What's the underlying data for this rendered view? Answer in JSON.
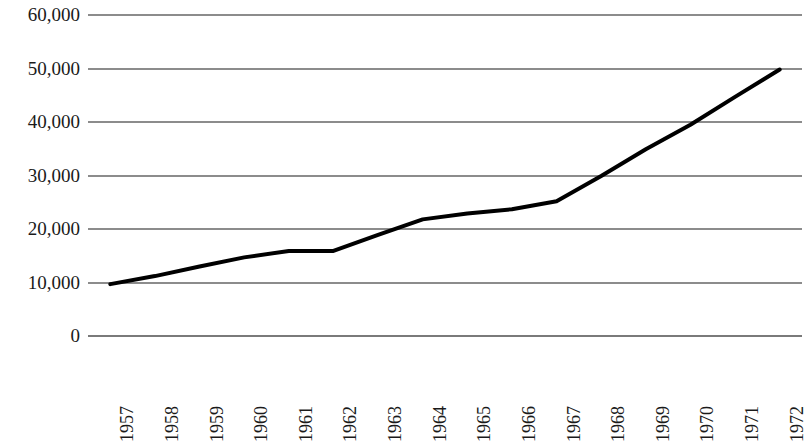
{
  "chart_data": {
    "type": "line",
    "title": "",
    "xlabel": "",
    "ylabel": "",
    "x": [
      1957,
      1958,
      1959,
      1960,
      1961,
      1962,
      1963,
      1964,
      1965,
      1966,
      1967,
      1968,
      1969,
      1970,
      1971,
      1972
    ],
    "categories": [
      "1957",
      "1958",
      "1959",
      "1960",
      "1961",
      "1962",
      "1963",
      "1964",
      "1965",
      "1966",
      "1967",
      "1968",
      "1969",
      "1970",
      "1971",
      "1972"
    ],
    "series": [
      {
        "name": "",
        "values": [
          9700,
          11200,
          13000,
          14700,
          15900,
          15900,
          18900,
          21800,
          22900,
          23700,
          25200,
          29900,
          34900,
          39500,
          44700,
          49800
        ]
      }
    ],
    "values": [
      9700,
      11200,
      13000,
      14700,
      15900,
      15900,
      18900,
      21800,
      22900,
      23700,
      25200,
      29900,
      34900,
      39500,
      44700,
      49800
    ],
    "ylim": [
      0,
      60000
    ],
    "yticks": [
      0,
      10000,
      20000,
      30000,
      40000,
      50000,
      60000
    ],
    "ytick_labels": [
      "0",
      "10,000",
      "20,000",
      "30,000",
      "40,000",
      "50,000",
      "60,000"
    ],
    "grid": true,
    "grid_axis": "y",
    "legend": false,
    "legend_position": "none",
    "line_color": "#000000",
    "grid_color": "#8c8c8c",
    "background_color": "#ffffff",
    "line_width": 4,
    "markers": false
  },
  "axes": {
    "y_ticks": [
      {
        "label": "60,000",
        "value": 60000
      },
      {
        "label": "50,000",
        "value": 50000
      },
      {
        "label": "40,000",
        "value": 40000
      },
      {
        "label": "30,000",
        "value": 30000
      },
      {
        "label": "20,000",
        "value": 20000
      },
      {
        "label": "10,000",
        "value": 10000
      },
      {
        "label": "0",
        "value": 0
      }
    ],
    "x_ticks": [
      {
        "label": "1957"
      },
      {
        "label": "1958"
      },
      {
        "label": "1959"
      },
      {
        "label": "1960"
      },
      {
        "label": "1961"
      },
      {
        "label": "1962"
      },
      {
        "label": "1963"
      },
      {
        "label": "1964"
      },
      {
        "label": "1965"
      },
      {
        "label": "1966"
      },
      {
        "label": "1967"
      },
      {
        "label": "1968"
      },
      {
        "label": "1969"
      },
      {
        "label": "1970"
      },
      {
        "label": "1971"
      },
      {
        "label": "1972"
      }
    ]
  },
  "title": {
    "text": ""
  }
}
